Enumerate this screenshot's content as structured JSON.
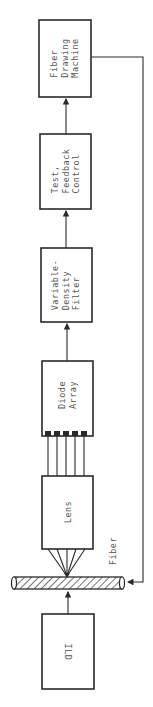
{
  "diagram": {
    "type": "block-flow",
    "orientation": "rotated-90ccw",
    "blocks": [
      {
        "id": "fiber_drawing_machine",
        "lines": [
          "Fiber",
          "Drawing",
          "Machine"
        ]
      },
      {
        "id": "test_feedback_control",
        "lines": [
          "Test,",
          "Feedback",
          "Control"
        ]
      },
      {
        "id": "variable_density_filter",
        "lines": [
          "Variable-",
          "Density",
          "Filter"
        ]
      },
      {
        "id": "diode_array",
        "lines": [
          "Diode",
          "Array"
        ],
        "terminals": 5
      },
      {
        "id": "lens",
        "lines": [
          "Lens"
        ]
      },
      {
        "id": "ild",
        "lines": [
          "ILD"
        ]
      }
    ],
    "fiber_label": "Fiber",
    "connections": [
      {
        "from": "ild",
        "to": "fiber",
        "arrow": true
      },
      {
        "from": "fiber",
        "to": "lens",
        "kind": "focused-rays"
      },
      {
        "from": "lens",
        "to": "diode_array",
        "kind": "5 parallel lines"
      },
      {
        "from": "diode_array",
        "to": "variable_density_filter",
        "arrow": true
      },
      {
        "from": "variable_density_filter",
        "to": "test_feedback_control",
        "arrow": true
      },
      {
        "from": "test_feedback_control",
        "to": "fiber_drawing_machine",
        "arrow": true
      },
      {
        "from": "fiber_drawing_machine",
        "to": "fiber",
        "arrow": true,
        "kind": "feedback loop"
      }
    ]
  }
}
